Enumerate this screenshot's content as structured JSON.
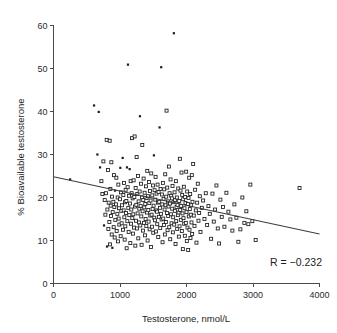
{
  "chart_data": {
    "type": "scatter",
    "title": "",
    "xlabel": "Testosterone, nmol/L",
    "ylabel": "% Bioavailable testosterone",
    "xlim": [
      0,
      4000
    ],
    "ylim": [
      0,
      60
    ],
    "xticks": [
      0,
      1000,
      2000,
      3000,
      4000
    ],
    "yticks": [
      0,
      10,
      20,
      30,
      40,
      50,
      60
    ],
    "xtick_labels": [
      "0",
      "1000",
      "2000",
      "3000",
      "4000"
    ],
    "ytick_labels": [
      "0",
      "10",
      "20",
      "30",
      "40",
      "50",
      "60"
    ],
    "grid": false,
    "legend": null,
    "annotations": [
      {
        "text": "R = −0.232",
        "x": 3450,
        "y": 4.5
      }
    ],
    "correlation_R": -0.232,
    "trendline": {
      "type": "linear",
      "x_start": 0,
      "y_start": 24.8,
      "x_end": 4000,
      "y_end": 11.5,
      "slope_per_1000": -3.325,
      "intercept": 24.8
    },
    "marker_styles": [
      "open-square",
      "filled-dot"
    ],
    "n_points": 318,
    "points": [
      [
        250,
        24.2,
        "d"
      ],
      [
        610,
        41.4,
        "d"
      ],
      [
        660,
        30.0,
        "d"
      ],
      [
        680,
        39.9,
        "d"
      ],
      [
        700,
        27.0,
        "d"
      ],
      [
        720,
        23.8,
        "s"
      ],
      [
        735,
        20.8,
        "s"
      ],
      [
        750,
        28.4,
        "s"
      ],
      [
        760,
        13.5,
        "d"
      ],
      [
        770,
        19.4,
        "s"
      ],
      [
        780,
        16.0,
        "s"
      ],
      [
        790,
        21.0,
        "s"
      ],
      [
        800,
        33.4,
        "s"
      ],
      [
        805,
        8.6,
        "d"
      ],
      [
        810,
        17.2,
        "s"
      ],
      [
        820,
        26.4,
        "s"
      ],
      [
        825,
        12.7,
        "s"
      ],
      [
        830,
        18.8,
        "s"
      ],
      [
        840,
        14.3,
        "s"
      ],
      [
        845,
        33.2,
        "s"
      ],
      [
        850,
        9.1,
        "s"
      ],
      [
        855,
        22.0,
        "s"
      ],
      [
        860,
        18.1,
        "s"
      ],
      [
        865,
        15.7,
        "s"
      ],
      [
        870,
        28.2,
        "s"
      ],
      [
        875,
        11.4,
        "s"
      ],
      [
        880,
        20.2,
        "s"
      ],
      [
        885,
        8.3,
        "d"
      ],
      [
        890,
        16.6,
        "s"
      ],
      [
        900,
        19.0,
        "s"
      ],
      [
        905,
        13.1,
        "s"
      ],
      [
        910,
        25.2,
        "s"
      ],
      [
        915,
        17.8,
        "s"
      ],
      [
        920,
        10.7,
        "s"
      ],
      [
        925,
        21.6,
        "d"
      ],
      [
        930,
        14.8,
        "s"
      ],
      [
        940,
        18.4,
        "s"
      ],
      [
        945,
        24.6,
        "s"
      ],
      [
        950,
        12.2,
        "s"
      ],
      [
        960,
        16.2,
        "s"
      ],
      [
        965,
        20.0,
        "s"
      ],
      [
        970,
        9.8,
        "s"
      ],
      [
        975,
        23.0,
        "s"
      ],
      [
        980,
        15.1,
        "s"
      ],
      [
        985,
        17.5,
        "s"
      ],
      [
        990,
        13.7,
        "s"
      ],
      [
        1000,
        19.6,
        "s"
      ],
      [
        1005,
        26.9,
        "d"
      ],
      [
        1010,
        11.0,
        "s"
      ],
      [
        1015,
        21.2,
        "s"
      ],
      [
        1020,
        16.9,
        "s"
      ],
      [
        1025,
        14.0,
        "s"
      ],
      [
        1030,
        18.2,
        "s"
      ],
      [
        1040,
        29.2,
        "d"
      ],
      [
        1045,
        12.5,
        "s"
      ],
      [
        1050,
        20.6,
        "s"
      ],
      [
        1055,
        17.0,
        "s"
      ],
      [
        1060,
        23.4,
        "s"
      ],
      [
        1065,
        15.4,
        "s"
      ],
      [
        1070,
        10.2,
        "s"
      ],
      [
        1075,
        18.9,
        "s"
      ],
      [
        1080,
        13.3,
        "s"
      ],
      [
        1085,
        21.8,
        "s"
      ],
      [
        1090,
        16.4,
        "s"
      ],
      [
        1095,
        19.2,
        "s"
      ],
      [
        1100,
        8.2,
        "s"
      ],
      [
        1105,
        27.0,
        "d"
      ],
      [
        1110,
        14.5,
        "s"
      ],
      [
        1115,
        22.4,
        "s"
      ],
      [
        1120,
        50.9,
        "d"
      ],
      [
        1125,
        17.6,
        "s"
      ],
      [
        1130,
        12.0,
        "s"
      ],
      [
        1135,
        20.4,
        "s"
      ],
      [
        1140,
        15.9,
        "s"
      ],
      [
        1145,
        26.6,
        "d"
      ],
      [
        1150,
        18.6,
        "s"
      ],
      [
        1155,
        9.4,
        "s"
      ],
      [
        1160,
        23.8,
        "s"
      ],
      [
        1165,
        13.9,
        "s"
      ],
      [
        1170,
        17.2,
        "s"
      ],
      [
        1175,
        21.0,
        "s"
      ],
      [
        1180,
        33.8,
        "s"
      ],
      [
        1185,
        15.2,
        "s"
      ],
      [
        1190,
        19.8,
        "s"
      ],
      [
        1195,
        11.6,
        "s"
      ],
      [
        1200,
        16.1,
        "s"
      ],
      [
        1205,
        24.0,
        "s"
      ],
      [
        1210,
        13.0,
        "s"
      ],
      [
        1215,
        20.1,
        "s"
      ],
      [
        1220,
        34.2,
        "s"
      ],
      [
        1225,
        17.9,
        "s"
      ],
      [
        1230,
        8.8,
        "s"
      ],
      [
        1235,
        22.2,
        "s"
      ],
      [
        1240,
        14.6,
        "s"
      ],
      [
        1245,
        18.3,
        "s"
      ],
      [
        1250,
        29.4,
        "s"
      ],
      [
        1255,
        12.8,
        "s"
      ],
      [
        1260,
        20.8,
        "s"
      ],
      [
        1265,
        16.3,
        "s"
      ],
      [
        1270,
        25.0,
        "s"
      ],
      [
        1275,
        10.5,
        "s"
      ],
      [
        1280,
        19.1,
        "s"
      ],
      [
        1285,
        14.2,
        "s"
      ],
      [
        1290,
        17.4,
        "s"
      ],
      [
        1295,
        21.4,
        "s"
      ],
      [
        1300,
        38.9,
        "d"
      ],
      [
        1305,
        13.5,
        "s"
      ],
      [
        1310,
        18.0,
        "s"
      ],
      [
        1315,
        23.2,
        "s"
      ],
      [
        1320,
        15.6,
        "s"
      ],
      [
        1325,
        9.0,
        "s"
      ],
      [
        1330,
        20.0,
        "s"
      ],
      [
        1335,
        32.2,
        "s"
      ],
      [
        1340,
        16.8,
        "s"
      ],
      [
        1345,
        12.3,
        "s"
      ],
      [
        1350,
        19.4,
        "s"
      ],
      [
        1355,
        24.4,
        "s"
      ],
      [
        1360,
        14.1,
        "s"
      ],
      [
        1365,
        17.7,
        "s"
      ],
      [
        1370,
        21.1,
        "s"
      ],
      [
        1375,
        11.2,
        "s"
      ],
      [
        1380,
        18.5,
        "s"
      ],
      [
        1385,
        15.0,
        "s"
      ],
      [
        1390,
        22.6,
        "s"
      ],
      [
        1395,
        13.4,
        "s"
      ],
      [
        1400,
        19.9,
        "s"
      ],
      [
        1405,
        16.5,
        "s"
      ],
      [
        1410,
        26.2,
        "s"
      ],
      [
        1415,
        10.0,
        "s"
      ],
      [
        1420,
        20.3,
        "s"
      ],
      [
        1425,
        17.1,
        "s"
      ],
      [
        1430,
        14.4,
        "s"
      ],
      [
        1435,
        23.6,
        "s"
      ],
      [
        1440,
        18.7,
        "s"
      ],
      [
        1445,
        12.6,
        "s"
      ],
      [
        1450,
        21.5,
        "s"
      ],
      [
        1455,
        15.8,
        "s"
      ],
      [
        1460,
        19.3,
        "s"
      ],
      [
        1465,
        8.5,
        "s"
      ],
      [
        1470,
        25.6,
        "s"
      ],
      [
        1475,
        16.0,
        "s"
      ],
      [
        1480,
        13.2,
        "s"
      ],
      [
        1485,
        20.5,
        "s"
      ],
      [
        1490,
        17.3,
        "s"
      ],
      [
        1495,
        22.8,
        "s"
      ],
      [
        1500,
        11.8,
        "s"
      ],
      [
        1505,
        18.1,
        "s"
      ],
      [
        1510,
        29.8,
        "d"
      ],
      [
        1515,
        15.3,
        "s"
      ],
      [
        1520,
        21.7,
        "s"
      ],
      [
        1525,
        14.7,
        "s"
      ],
      [
        1530,
        19.5,
        "s"
      ],
      [
        1535,
        24.8,
        "s"
      ],
      [
        1540,
        12.1,
        "s"
      ],
      [
        1545,
        17.0,
        "s"
      ],
      [
        1550,
        20.9,
        "s"
      ],
      [
        1555,
        16.7,
        "s"
      ],
      [
        1560,
        13.8,
        "s"
      ],
      [
        1565,
        23.0,
        "s"
      ],
      [
        1570,
        18.8,
        "s"
      ],
      [
        1575,
        10.8,
        "s"
      ],
      [
        1580,
        21.3,
        "s"
      ],
      [
        1585,
        15.5,
        "s"
      ],
      [
        1590,
        19.0,
        "s"
      ],
      [
        1595,
        36.3,
        "d"
      ],
      [
        1600,
        17.6,
        "s"
      ],
      [
        1605,
        12.9,
        "s"
      ],
      [
        1610,
        22.0,
        "s"
      ],
      [
        1615,
        16.2,
        "s"
      ],
      [
        1620,
        50.3,
        "d"
      ],
      [
        1625,
        14.9,
        "s"
      ],
      [
        1630,
        20.7,
        "s"
      ],
      [
        1635,
        18.4,
        "s"
      ],
      [
        1640,
        9.6,
        "s"
      ],
      [
        1645,
        23.4,
        "s"
      ],
      [
        1650,
        15.1,
        "s"
      ],
      [
        1655,
        19.7,
        "s"
      ],
      [
        1660,
        13.6,
        "s"
      ],
      [
        1665,
        21.9,
        "s"
      ],
      [
        1670,
        17.2,
        "s"
      ],
      [
        1675,
        11.4,
        "s"
      ],
      [
        1680,
        25.4,
        "s"
      ],
      [
        1685,
        18.2,
        "s"
      ],
      [
        1690,
        14.3,
        "s"
      ],
      [
        1695,
        20.2,
        "s"
      ],
      [
        1700,
        40.2,
        "s"
      ],
      [
        1705,
        16.4,
        "s"
      ],
      [
        1710,
        22.3,
        "s"
      ],
      [
        1715,
        12.4,
        "s"
      ],
      [
        1720,
        19.1,
        "s"
      ],
      [
        1725,
        15.7,
        "s"
      ],
      [
        1730,
        17.9,
        "s"
      ],
      [
        1735,
        27.2,
        "s"
      ],
      [
        1740,
        13.1,
        "s"
      ],
      [
        1745,
        21.0,
        "s"
      ],
      [
        1750,
        18.6,
        "s"
      ],
      [
        1755,
        10.3,
        "s"
      ],
      [
        1760,
        24.2,
        "s"
      ],
      [
        1765,
        16.1,
        "s"
      ],
      [
        1770,
        20.4,
        "s"
      ],
      [
        1775,
        14.0,
        "s"
      ],
      [
        1780,
        19.8,
        "s"
      ],
      [
        1785,
        17.4,
        "s"
      ],
      [
        1790,
        22.7,
        "s"
      ],
      [
        1795,
        11.9,
        "s"
      ],
      [
        1800,
        15.4,
        "s"
      ],
      [
        1805,
        18.9,
        "s"
      ],
      [
        1810,
        58.2,
        "d"
      ],
      [
        1815,
        13.7,
        "s"
      ],
      [
        1820,
        21.2,
        "s"
      ],
      [
        1825,
        16.9,
        "s"
      ],
      [
        1830,
        19.4,
        "s"
      ],
      [
        1835,
        9.2,
        "s"
      ],
      [
        1840,
        23.8,
        "s"
      ],
      [
        1845,
        14.5,
        "s"
      ],
      [
        1850,
        17.8,
        "s"
      ],
      [
        1855,
        20.0,
        "s"
      ],
      [
        1860,
        12.7,
        "s"
      ],
      [
        1865,
        18.3,
        "s"
      ],
      [
        1870,
        15.9,
        "s"
      ],
      [
        1875,
        22.1,
        "s"
      ],
      [
        1880,
        16.5,
        "s"
      ],
      [
        1885,
        10.9,
        "s"
      ],
      [
        1890,
        19.2,
        "s"
      ],
      [
        1895,
        13.3,
        "s"
      ],
      [
        1900,
        29.0,
        "s"
      ],
      [
        1905,
        17.1,
        "s"
      ],
      [
        1910,
        21.6,
        "s"
      ],
      [
        1915,
        14.8,
        "s"
      ],
      [
        1920,
        18.0,
        "s"
      ],
      [
        1925,
        25.8,
        "s"
      ],
      [
        1930,
        12.2,
        "s"
      ],
      [
        1935,
        20.6,
        "s"
      ],
      [
        1940,
        16.3,
        "s"
      ],
      [
        1945,
        8.0,
        "s"
      ],
      [
        1950,
        19.6,
        "s"
      ],
      [
        1955,
        15.2,
        "s"
      ],
      [
        1960,
        22.5,
        "s"
      ],
      [
        1965,
        13.9,
        "s"
      ],
      [
        1970,
        17.5,
        "s"
      ],
      [
        1975,
        11.1,
        "s"
      ],
      [
        1980,
        20.1,
        "s"
      ],
      [
        1985,
        18.7,
        "s"
      ],
      [
        1990,
        14.1,
        "s"
      ],
      [
        1995,
        26.0,
        "s"
      ],
      [
        2000,
        16.6,
        "s"
      ],
      [
        2005,
        9.9,
        "s"
      ],
      [
        2010,
        21.4,
        "s"
      ],
      [
        2015,
        13.0,
        "s"
      ],
      [
        2020,
        18.5,
        "s"
      ],
      [
        2025,
        7.8,
        "s"
      ],
      [
        2030,
        19.9,
        "s"
      ],
      [
        2035,
        15.6,
        "s"
      ],
      [
        2040,
        24.6,
        "s"
      ],
      [
        2045,
        12.5,
        "s"
      ],
      [
        2050,
        17.3,
        "s"
      ],
      [
        2055,
        20.8,
        "s"
      ],
      [
        2060,
        10.6,
        "s"
      ],
      [
        2065,
        16.0,
        "s"
      ],
      [
        2070,
        18.2,
        "s"
      ],
      [
        2075,
        14.2,
        "s"
      ],
      [
        2080,
        25.2,
        "s"
      ],
      [
        2085,
        11.5,
        "s"
      ],
      [
        2090,
        19.0,
        "s"
      ],
      [
        2100,
        27.8,
        "s"
      ],
      [
        2110,
        15.8,
        "s"
      ],
      [
        2120,
        13.4,
        "s"
      ],
      [
        2130,
        21.8,
        "s"
      ],
      [
        2140,
        17.0,
        "s"
      ],
      [
        2150,
        9.5,
        "s"
      ],
      [
        2160,
        18.8,
        "s"
      ],
      [
        2170,
        23.2,
        "s"
      ],
      [
        2180,
        14.6,
        "s"
      ],
      [
        2190,
        16.4,
        "s"
      ],
      [
        2200,
        20.3,
        "s"
      ],
      [
        2210,
        12.0,
        "s"
      ],
      [
        2230,
        17.6,
        "s"
      ],
      [
        2250,
        19.3,
        "s"
      ],
      [
        2270,
        15.0,
        "s"
      ],
      [
        2290,
        21.0,
        "s"
      ],
      [
        2310,
        13.6,
        "s"
      ],
      [
        2330,
        18.0,
        "s"
      ],
      [
        2350,
        16.2,
        "s"
      ],
      [
        2370,
        10.4,
        "s"
      ],
      [
        2390,
        20.9,
        "s"
      ],
      [
        2410,
        14.4,
        "s"
      ],
      [
        2430,
        17.2,
        "s"
      ],
      [
        2450,
        22.8,
        "s"
      ],
      [
        2470,
        12.8,
        "s"
      ],
      [
        2490,
        9.3,
        "s"
      ],
      [
        2510,
        19.5,
        "s"
      ],
      [
        2530,
        15.5,
        "s"
      ],
      [
        2550,
        17.8,
        "s"
      ],
      [
        2570,
        13.2,
        "s"
      ],
      [
        2600,
        21.1,
        "s"
      ],
      [
        2630,
        16.7,
        "s"
      ],
      [
        2660,
        14.9,
        "s"
      ],
      [
        2690,
        12.3,
        "s"
      ],
      [
        2720,
        18.4,
        "s"
      ],
      [
        2750,
        15.3,
        "s"
      ],
      [
        2780,
        9.7,
        "s"
      ],
      [
        2810,
        12.6,
        "s"
      ],
      [
        2840,
        20.0,
        "s"
      ],
      [
        2870,
        14.1,
        "s"
      ],
      [
        2900,
        16.8,
        "s"
      ],
      [
        2930,
        13.8,
        "s"
      ],
      [
        2960,
        23.0,
        "s"
      ],
      [
        2990,
        14.5,
        "s"
      ],
      [
        3040,
        10.1,
        "s"
      ],
      [
        3700,
        22.2,
        "s"
      ]
    ]
  },
  "figure": {
    "background_color": "#ffffff",
    "axis_color": "#4a4a4a",
    "marker_color": "#1a1a1a",
    "line_color": "#3d3d3d"
  }
}
